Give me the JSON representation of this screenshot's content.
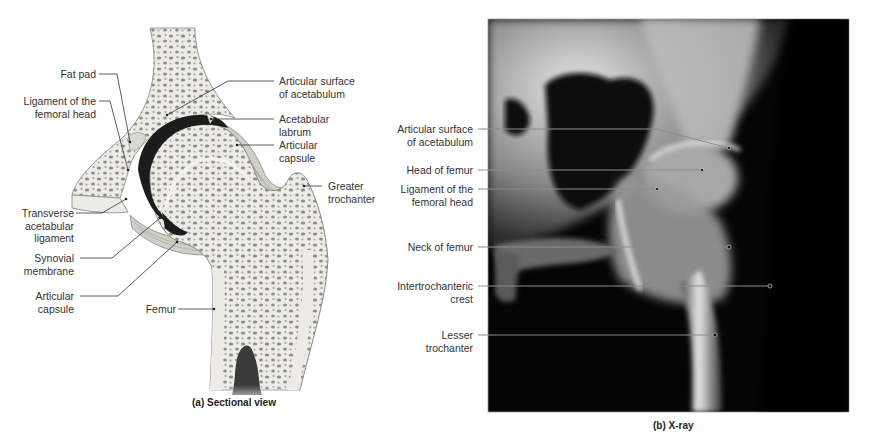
{
  "figure": {
    "panel_a": {
      "caption": "(a) Sectional view",
      "labels_left": [
        {
          "id": "fat-pad",
          "text": "Fat pad"
        },
        {
          "id": "ligament-femoral-head",
          "text": "Ligament of the\nfemoral head"
        },
        {
          "id": "transverse-acetabular-ligament",
          "text": "Transverse\nacetabular\nligament"
        },
        {
          "id": "synovial-membrane",
          "text": "Synovial\nmembrane"
        },
        {
          "id": "articular-capsule-lower",
          "text": "Articular\ncapsule"
        },
        {
          "id": "femur",
          "text": "Femur"
        }
      ],
      "labels_right": [
        {
          "id": "articular-surface-acetabulum",
          "text": "Articular surface\nof acetabulum"
        },
        {
          "id": "acetabular-labrum",
          "text": "Acetabular\nlabrum"
        },
        {
          "id": "articular-capsule-upper",
          "text": "Articular\ncapsule"
        },
        {
          "id": "greater-trochanter",
          "text": "Greater\ntrochanter"
        }
      ]
    },
    "panel_b": {
      "caption": "(b) X-ray",
      "labels": [
        {
          "id": "articular-surface-acetabulum",
          "text": "Articular surface\nof acetabulum"
        },
        {
          "id": "head-of-femur",
          "text": "Head of femur"
        },
        {
          "id": "ligament-femoral-head",
          "text": "Ligament of the\nfemoral head"
        },
        {
          "id": "neck-of-femur",
          "text": "Neck of femur"
        },
        {
          "id": "intertrochanteric-crest",
          "text": "Intertrochanteric\ncrest"
        },
        {
          "id": "lesser-trochanter",
          "text": "Lesser\ntrochanter"
        }
      ]
    },
    "colors": {
      "bone_fill": "#ecebe6",
      "spongy_dots": "#8a8a86",
      "cartilage_dark": "#1a1a1a",
      "capsule": "#b9b8b2",
      "xray_bg": "#050505",
      "leader_line": "#333333",
      "xray_leader": "#8c8c8c"
    }
  }
}
